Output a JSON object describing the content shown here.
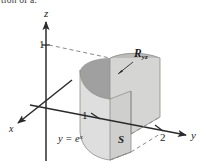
{
  "figure": {
    "caption_fragment": "tion of a.",
    "background_color": "#ffffff",
    "line_color": "#2b2b2b",
    "dashed_color": "#8a8a8a",
    "fill_front": "#d8d8d6",
    "fill_side": "#c6c6c4",
    "fill_top": "#b8b8b6",
    "fill_dark": "#9a9a9a",
    "fill_bottom": "#e2e2e0"
  },
  "axes": {
    "z": {
      "label": "z"
    },
    "y": {
      "label": "y"
    },
    "x": {
      "label": "x"
    }
  },
  "ticks": [
    {
      "name": "z-one",
      "label": "1",
      "axis": "z",
      "value": 1
    },
    {
      "name": "y-one",
      "label": "1",
      "axis": "y",
      "value": 1
    },
    {
      "name": "y-two",
      "label": "2",
      "axis": "y",
      "value": 2
    }
  ],
  "annotations": {
    "region": {
      "base": "R",
      "subscript": "yz"
    },
    "curve": {
      "lhs": "y =",
      "base": "e",
      "exponent": "x"
    },
    "solid": {
      "label": "S"
    }
  }
}
